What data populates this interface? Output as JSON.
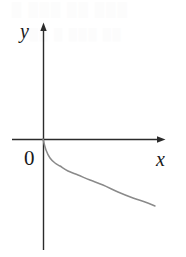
{
  "figure": {
    "caption": "",
    "background_color": "#ffffff",
    "axis_color": "#2b2b2b",
    "curve_color": "#8a8a8a",
    "label_color": "#1a1a1a",
    "labels": {
      "y_axis": "y",
      "x_axis": "x",
      "origin": "0"
    },
    "artifacts": [
      {
        "text": "█ ███ ██ ███",
        "left": 12,
        "top": 2,
        "size": 13
      },
      {
        "text": "██ █ ███ ██",
        "left": 30,
        "top": 28,
        "size": 11
      }
    ]
  },
  "chart_data": {
    "type": "line",
    "title": "",
    "xlabel": "x",
    "ylabel": "y",
    "subtitle": "",
    "legend": [],
    "legend_position": "none",
    "grid": false,
    "axis_arrows": {
      "x": "right",
      "y": "up"
    },
    "origin_label": "0",
    "origin_px": {
      "x": 43,
      "y": 139
    },
    "axis_extent_px": {
      "x_start": 12,
      "x_end": 166,
      "y_start": 22,
      "y_end": 250
    },
    "xlim": [
      0,
      12
    ],
    "ylim": [
      -8,
      9
    ],
    "series": [
      {
        "name": "y = log_a(x), 0 < a < 1",
        "description": "decreasing logarithmic curve through (1,0) falling into the fourth quadrant",
        "points_px": [
          [
            43,
            139
          ],
          [
            46,
            150
          ],
          [
            50,
            158
          ],
          [
            55,
            163
          ],
          [
            60,
            166
          ],
          [
            68,
            171
          ],
          [
            78,
            175
          ],
          [
            90,
            180
          ],
          [
            103,
            185
          ],
          [
            118,
            192
          ],
          [
            133,
            198
          ],
          [
            145,
            202
          ],
          [
            155,
            206
          ]
        ]
      }
    ]
  }
}
